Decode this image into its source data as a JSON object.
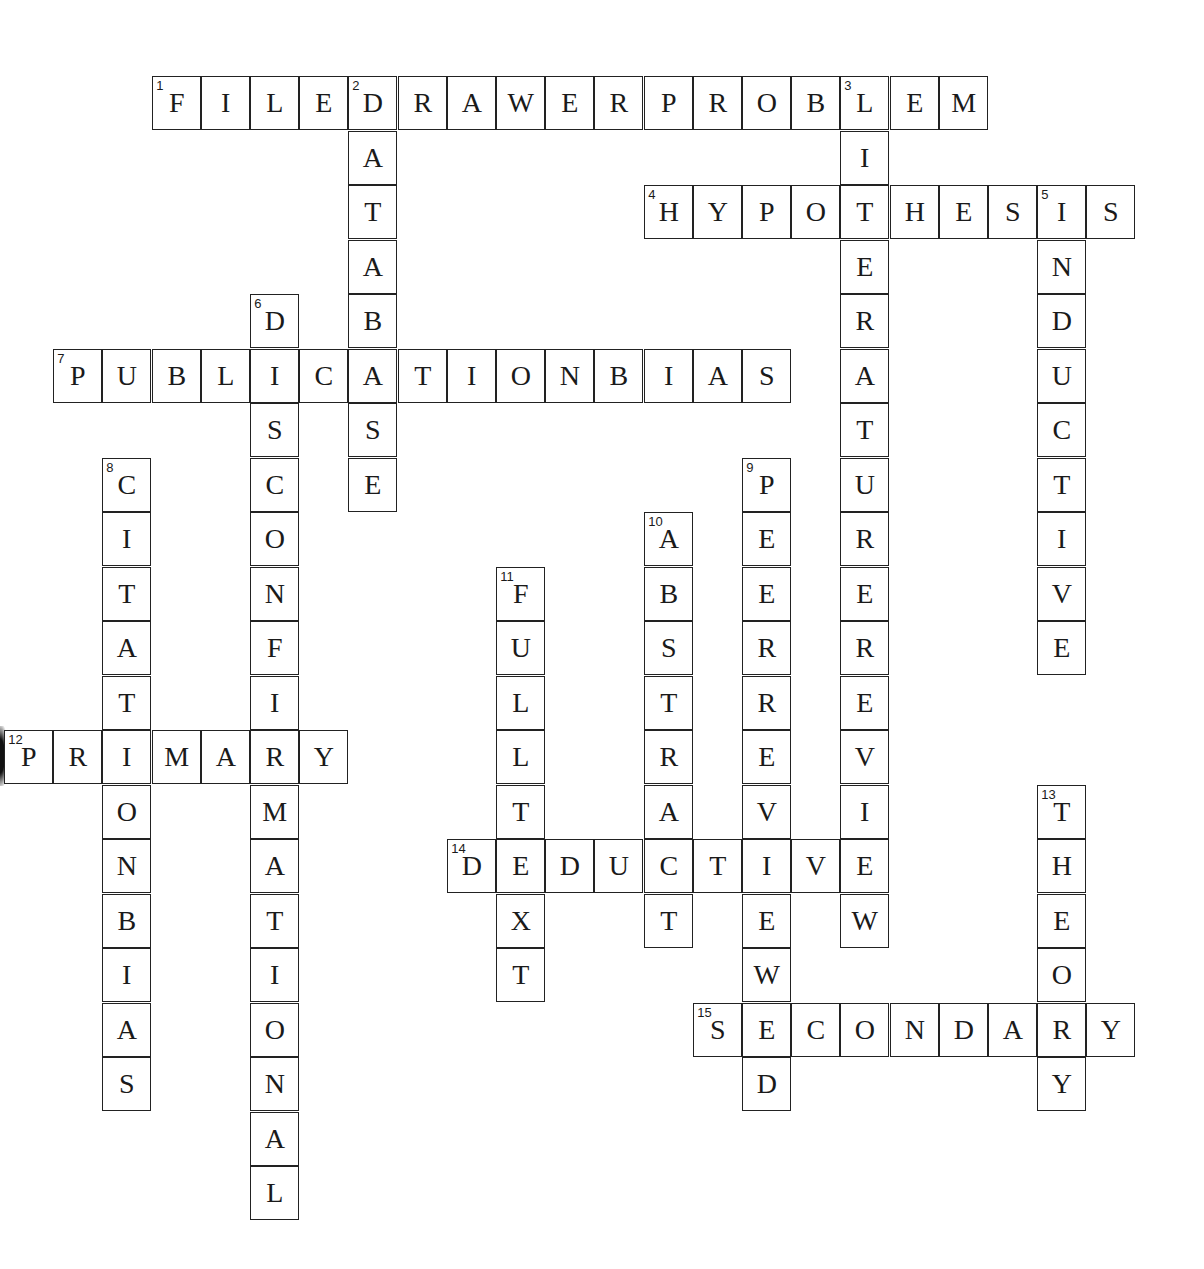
{
  "puzzle": {
    "grid": {
      "origin_x": 5,
      "origin_y": 77,
      "cell_w": 49.2,
      "cell_h": 54.5
    },
    "words": [
      {
        "number": 1,
        "answer": "FILEDRAWERPROBLEM",
        "direction": "across",
        "col": 3,
        "row": 0
      },
      {
        "number": 2,
        "answer": "DATABASE",
        "direction": "down",
        "col": 7,
        "row": 0
      },
      {
        "number": 3,
        "answer": "LITERATUREREVIEW",
        "direction": "down",
        "col": 17,
        "row": 0
      },
      {
        "number": 4,
        "answer": "HYPOTHESIS",
        "direction": "across",
        "col": 13,
        "row": 2
      },
      {
        "number": 5,
        "answer": "INDUCTIVE",
        "direction": "down",
        "col": 21,
        "row": 2
      },
      {
        "number": 6,
        "answer": "DISCONFIRMATIONAL",
        "direction": "down",
        "col": 5,
        "row": 4
      },
      {
        "number": 7,
        "answer": "PUBLICATIONBIAS",
        "direction": "across",
        "col": 1,
        "row": 5
      },
      {
        "number": 8,
        "answer": "CITATIONBIAS",
        "direction": "down",
        "col": 2,
        "row": 7
      },
      {
        "number": 9,
        "answer": "PEERREVIEWED",
        "direction": "down",
        "col": 15,
        "row": 7
      },
      {
        "number": 10,
        "answer": "ABSTRACT",
        "direction": "down",
        "col": 13,
        "row": 8
      },
      {
        "number": 11,
        "answer": "FULLTEXT",
        "direction": "down",
        "col": 10,
        "row": 9
      },
      {
        "number": 12,
        "answer": "PRIMARY",
        "direction": "across",
        "col": 0,
        "row": 12
      },
      {
        "number": 13,
        "answer": "THEORY",
        "direction": "down",
        "col": 21,
        "row": 13
      },
      {
        "number": 14,
        "answer": "DEDUCTIVE",
        "direction": "across",
        "col": 9,
        "row": 14
      },
      {
        "number": 15,
        "answer": "SECONDARY",
        "direction": "across",
        "col": 14,
        "row": 17
      }
    ]
  }
}
